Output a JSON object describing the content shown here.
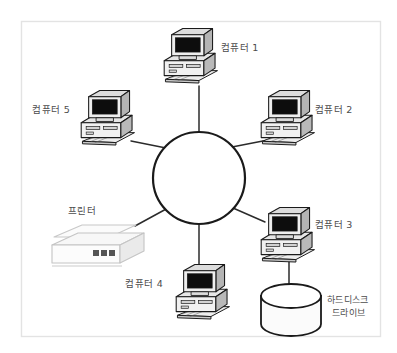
{
  "diagram": {
    "type": "star-network-topology",
    "title_text": "",
    "frame": {
      "border_color": "#e2e2e2",
      "background": "#ffffff",
      "x": 21,
      "y": 21,
      "width": 360,
      "height": 316
    },
    "hub": {
      "name": "network-hub-circle",
      "cx": 199,
      "cy": 178,
      "r": 46,
      "stroke": "#1a1a1a",
      "stroke_width": 2.2,
      "fill": "#ffffff"
    },
    "colors": {
      "line": "#2b2b2b",
      "screen": "#101010",
      "case_light": "#f2f2f2",
      "case_mid": "#d8d8d8",
      "case_dark": "#a8a8a8",
      "outline": "#1a1a1a",
      "text": "#4c4c4c"
    },
    "nodes": [
      {
        "id": "computer-1",
        "kind": "computer",
        "label": "컴퓨터 1",
        "icon": "desktop-computer-icon",
        "icon_x": 158,
        "icon_y": 26,
        "icon_scale": 0.62,
        "label_x": 221,
        "label_y": 51,
        "label_anchor": "start",
        "link": {
          "x1": 199,
          "y1": 86,
          "x2": 199,
          "y2": 132
        }
      },
      {
        "id": "computer-2",
        "kind": "computer",
        "label": "컴퓨터 2",
        "icon": "desktop-computer-icon",
        "icon_x": 255,
        "icon_y": 88,
        "icon_scale": 0.62,
        "label_x": 315,
        "label_y": 113,
        "label_anchor": "start",
        "link": {
          "x1": 268,
          "y1": 140,
          "x2": 232,
          "y2": 147
        }
      },
      {
        "id": "computer-3",
        "kind": "computer",
        "label": "컴퓨터 3",
        "icon": "desktop-computer-icon",
        "icon_x": 255,
        "icon_y": 205,
        "icon_scale": 0.62,
        "label_x": 315,
        "label_y": 228,
        "label_anchor": "start",
        "link": {
          "x1": 265,
          "y1": 222,
          "x2": 233,
          "y2": 208
        }
      },
      {
        "id": "computer-4",
        "kind": "computer",
        "label": "컴퓨터 4",
        "icon": "desktop-computer-icon",
        "icon_x": 170,
        "icon_y": 262,
        "icon_scale": 0.62,
        "label_x": 163,
        "label_y": 287,
        "label_anchor": "end",
        "link": {
          "x1": 199,
          "y1": 224,
          "x2": 199,
          "y2": 266
        }
      },
      {
        "id": "computer-5",
        "kind": "computer",
        "label": "컴퓨터 5",
        "icon": "desktop-computer-icon",
        "icon_x": 75,
        "icon_y": 88,
        "icon_scale": 0.62,
        "label_x": 70,
        "label_y": 113,
        "label_anchor": "end",
        "link": {
          "x1": 131,
          "y1": 141,
          "x2": 166,
          "y2": 148
        }
      },
      {
        "id": "printer",
        "kind": "printer",
        "label": "프린터",
        "icon": "laser-printer-icon",
        "icon_x": 48,
        "icon_y": 219,
        "icon_scale": 1,
        "label_x": 68,
        "label_y": 214,
        "label_anchor": "start",
        "link": {
          "x1": 135,
          "y1": 226,
          "x2": 168,
          "y2": 208
        }
      },
      {
        "id": "hard-disk-drive",
        "kind": "storage",
        "label": "하드디스크",
        "label2": "드라이브",
        "icon": "hard-disk-cylinder-icon",
        "icon_x": 259,
        "icon_y": 284,
        "icon_scale": 1,
        "label_x": 327,
        "label_y": 303,
        "label2_x": 327,
        "label2_y": 315,
        "label_anchor": "start",
        "link": {
          "x1": 289,
          "y1": 262,
          "x2": 289,
          "y2": 288
        }
      }
    ]
  }
}
